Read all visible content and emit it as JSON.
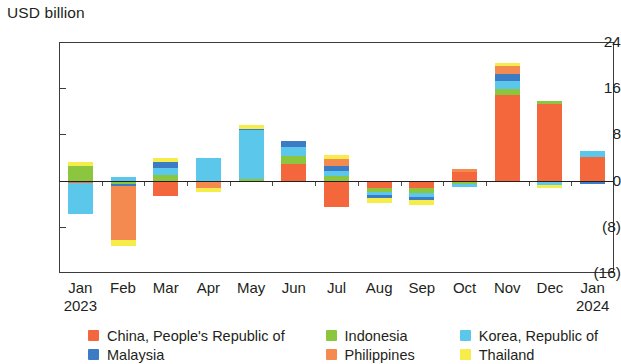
{
  "chart_data": {
    "type": "bar",
    "title": "",
    "subtitle": "",
    "ylabel": "USD billion",
    "xlabel": "",
    "ylim": [
      -16,
      24
    ],
    "yticks": [
      24,
      16,
      8,
      0,
      -8,
      -16
    ],
    "ytick_labels": [
      "24",
      "16",
      "8",
      "0",
      "(8)",
      "(16)"
    ],
    "grid": false,
    "stacked": true,
    "legend_position": "bottom",
    "categories": [
      "Jan",
      "Feb",
      "Mar",
      "Apr",
      "May",
      "Jun",
      "Jul",
      "Aug",
      "Sep",
      "Oct",
      "Nov",
      "Dec",
      "Jan"
    ],
    "category_years": [
      "2023",
      "",
      "",
      "",
      "",
      "",
      "",
      "",
      "",
      "",
      "",
      "",
      "2024"
    ],
    "series": [
      {
        "name": "China, People's Republic of",
        "color": "#F4663B",
        "values": [
          -0.5,
          0.0,
          -2.7,
          0.0,
          0.0,
          2.9,
          -4.6,
          -1.2,
          -1.3,
          1.5,
          14.9,
          13.2,
          4.1
        ]
      },
      {
        "name": "Indonesia",
        "color": "#8CC63F",
        "values": [
          2.6,
          -0.6,
          0.9,
          0.0,
          0.3,
          1.4,
          0.8,
          -0.8,
          -0.9,
          -0.6,
          1.0,
          0.6,
          0.0
        ]
      },
      {
        "name": "Korea, Republic of",
        "color": "#5BC8EB",
        "values": [
          -5.3,
          0.6,
          1.3,
          3.9,
          8.4,
          1.5,
          0.9,
          -0.5,
          -0.6,
          -0.5,
          1.3,
          -0.8,
          1.1
        ]
      },
      {
        "name": "Malaysia",
        "color": "#3B7CC4",
        "values": [
          0.0,
          -0.4,
          1.1,
          0.0,
          0.3,
          1.1,
          0.9,
          -0.5,
          -0.6,
          0.0,
          1.2,
          0.0,
          -0.6
        ]
      },
      {
        "name": "Philippines",
        "color": "#F58A50",
        "values": [
          0.0,
          -9.3,
          0.0,
          -1.2,
          0.0,
          0.0,
          1.1,
          0.0,
          0.0,
          0.5,
          1.4,
          0.0,
          0.0
        ]
      },
      {
        "name": "Thailand",
        "color": "#F7ED4A",
        "values": [
          0.7,
          -1.0,
          0.6,
          -0.7,
          0.6,
          0.0,
          0.8,
          -0.8,
          -0.9,
          0.0,
          0.5,
          -0.4,
          0.0
        ]
      }
    ]
  },
  "legend": {
    "items": [
      {
        "label": "China, People's Republic of",
        "color": "#F4663B",
        "column": 1,
        "row": 1
      },
      {
        "label": "Indonesia",
        "color": "#8CC63F",
        "column": 2,
        "row": 1
      },
      {
        "label": "Korea, Republic of",
        "color": "#5BC8EB",
        "column": 3,
        "row": 1
      },
      {
        "label": "Malaysia",
        "color": "#3B7CC4",
        "column": 1,
        "row": 2
      },
      {
        "label": "Philippines",
        "color": "#F58A50",
        "column": 2,
        "row": 2
      },
      {
        "label": "Thailand",
        "color": "#F7ED4A",
        "column": 3,
        "row": 2
      }
    ]
  }
}
